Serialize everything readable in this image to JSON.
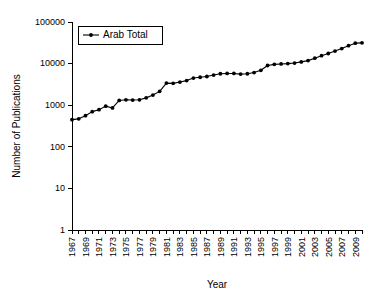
{
  "chart_data": {
    "type": "line",
    "title": "",
    "xlabel": "Year",
    "ylabel": "Number of Publications",
    "yscale": "log",
    "ylim": [
      1,
      100000
    ],
    "xlim": [
      1967,
      2010
    ],
    "grid": false,
    "legend_position": "top-left",
    "y_ticks": [
      1,
      10,
      100,
      1000,
      10000,
      100000
    ],
    "y_tick_labels": [
      "1",
      "10",
      "100",
      "1000",
      "10000",
      "100000"
    ],
    "x_tick_labels": [
      "1967",
      "1969",
      "1971",
      "1973",
      "1975",
      "1977",
      "1979",
      "1981",
      "1983",
      "1985",
      "1987",
      "1989",
      "1991",
      "1993",
      "1995",
      "1997",
      "1999",
      "2001",
      "2003",
      "2005",
      "2007",
      "2009"
    ],
    "x_tick_step": 2,
    "x_minor_tick_step": 1,
    "series": [
      {
        "name": "Arab Total",
        "color": "#000000",
        "marker": "filled-circle",
        "x": [
          1967,
          1968,
          1969,
          1970,
          1971,
          1972,
          1973,
          1974,
          1975,
          1976,
          1977,
          1978,
          1979,
          1980,
          1981,
          1982,
          1983,
          1984,
          1985,
          1986,
          1987,
          1988,
          1989,
          1990,
          1991,
          1992,
          1993,
          1994,
          1995,
          1996,
          1997,
          1998,
          1999,
          2000,
          2001,
          2002,
          2003,
          2004,
          2005,
          2006,
          2007,
          2008,
          2009,
          2010
        ],
        "values": [
          450,
          470,
          560,
          700,
          780,
          950,
          860,
          1300,
          1350,
          1330,
          1350,
          1500,
          1750,
          2150,
          3400,
          3350,
          3600,
          3900,
          4500,
          4700,
          4900,
          5300,
          5700,
          5800,
          5800,
          5600,
          5700,
          6100,
          6900,
          9000,
          9600,
          9800,
          10000,
          10300,
          11000,
          11800,
          13500,
          15500,
          17500,
          20000,
          23000,
          27000,
          31000,
          31500
        ]
      }
    ]
  },
  "legend": {
    "entries": [
      {
        "label": "Arab Total"
      }
    ]
  },
  "axes": {
    "x_title": "Year",
    "y_title": "Number of Publications"
  }
}
